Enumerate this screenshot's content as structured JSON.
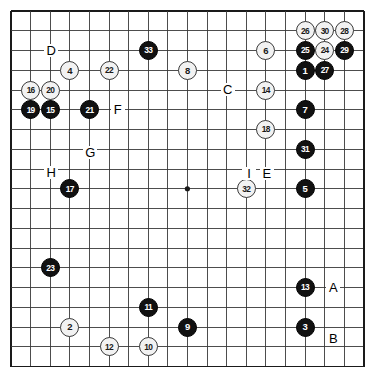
{
  "board": {
    "title": "Go game record diagram",
    "size": 19,
    "origin_x": 11,
    "origin_y": 11,
    "step_x": 19.6,
    "step_y": 19.75,
    "line_color": "#3a3a3a",
    "edge_color": "#1a1a1a",
    "background_color": "#ffffff",
    "black_color": "#111111",
    "white_color": "#f2f2f2",
    "star_points": [
      {
        "col": 3,
        "row": 3
      },
      {
        "col": 9,
        "row": 3
      },
      {
        "col": 15,
        "row": 3
      },
      {
        "col": 3,
        "row": 9
      },
      {
        "col": 9,
        "row": 9
      },
      {
        "col": 15,
        "row": 9
      },
      {
        "col": 3,
        "row": 15
      },
      {
        "col": 9,
        "row": 15
      },
      {
        "col": 15,
        "row": 15
      }
    ],
    "visible_star_points": [
      {
        "col": 9,
        "row": 9
      }
    ]
  },
  "stones": [
    {
      "label": "1",
      "color": "black",
      "col": 15,
      "row": 3
    },
    {
      "label": "2",
      "color": "white",
      "col": 3,
      "row": 16
    },
    {
      "label": "3",
      "color": "black",
      "col": 15,
      "row": 16
    },
    {
      "label": "4",
      "color": "white",
      "col": 3,
      "row": 3
    },
    {
      "label": "5",
      "color": "black",
      "col": 15,
      "row": 9
    },
    {
      "label": "6",
      "color": "white",
      "col": 13,
      "row": 2
    },
    {
      "label": "7",
      "color": "black",
      "col": 15,
      "row": 5
    },
    {
      "label": "8",
      "color": "white",
      "col": 9,
      "row": 3
    },
    {
      "label": "9",
      "color": "black",
      "col": 9,
      "row": 16
    },
    {
      "label": "10",
      "color": "white",
      "col": 7,
      "row": 17
    },
    {
      "label": "11",
      "color": "black",
      "col": 7,
      "row": 15
    },
    {
      "label": "12",
      "color": "white",
      "col": 5,
      "row": 17
    },
    {
      "label": "13",
      "color": "black",
      "col": 15,
      "row": 14
    },
    {
      "label": "14",
      "color": "white",
      "col": 13,
      "row": 4
    },
    {
      "label": "15",
      "color": "black",
      "col": 2,
      "row": 5
    },
    {
      "label": "16",
      "color": "white",
      "col": 1,
      "row": 4
    },
    {
      "label": "17",
      "color": "black",
      "col": 3,
      "row": 9
    },
    {
      "label": "18",
      "color": "white",
      "col": 13,
      "row": 6
    },
    {
      "label": "19",
      "color": "black",
      "col": 1,
      "row": 5
    },
    {
      "label": "20",
      "color": "white",
      "col": 2,
      "row": 4
    },
    {
      "label": "21",
      "color": "black",
      "col": 4,
      "row": 5
    },
    {
      "label": "22",
      "color": "white",
      "col": 5,
      "row": 3
    },
    {
      "label": "23",
      "color": "black",
      "col": 2,
      "row": 13
    },
    {
      "label": "24",
      "color": "white",
      "col": 16,
      "row": 2
    },
    {
      "label": "25",
      "color": "black",
      "col": 15,
      "row": 2
    },
    {
      "label": "26",
      "color": "white",
      "col": 15,
      "row": 1
    },
    {
      "label": "27",
      "color": "black",
      "col": 16,
      "row": 3
    },
    {
      "label": "28",
      "color": "white",
      "col": 17,
      "row": 1
    },
    {
      "label": "29",
      "color": "black",
      "col": 17,
      "row": 2
    },
    {
      "label": "30",
      "color": "white",
      "col": 16,
      "row": 1
    },
    {
      "label": "31",
      "color": "black",
      "col": 15,
      "row": 7
    },
    {
      "label": "32",
      "color": "white",
      "col": 12,
      "row": 9
    },
    {
      "label": "33",
      "color": "black",
      "col": 7,
      "row": 2
    }
  ],
  "markers": [
    {
      "label": "A",
      "col": 16.4,
      "row": 14
    },
    {
      "label": "B",
      "col": 16.4,
      "row": 16.6
    },
    {
      "label": "C",
      "col": 11,
      "row": 4
    },
    {
      "label": "D",
      "col": 2,
      "row": 2
    },
    {
      "label": "E",
      "col": 13,
      "row": 8.25
    },
    {
      "label": "F",
      "col": 5.4,
      "row": 5
    },
    {
      "label": "G",
      "col": 4,
      "row": 7.2
    },
    {
      "label": "H",
      "col": 2,
      "row": 8.2
    },
    {
      "label": "I",
      "col": 12.1,
      "row": 8.25
    }
  ]
}
